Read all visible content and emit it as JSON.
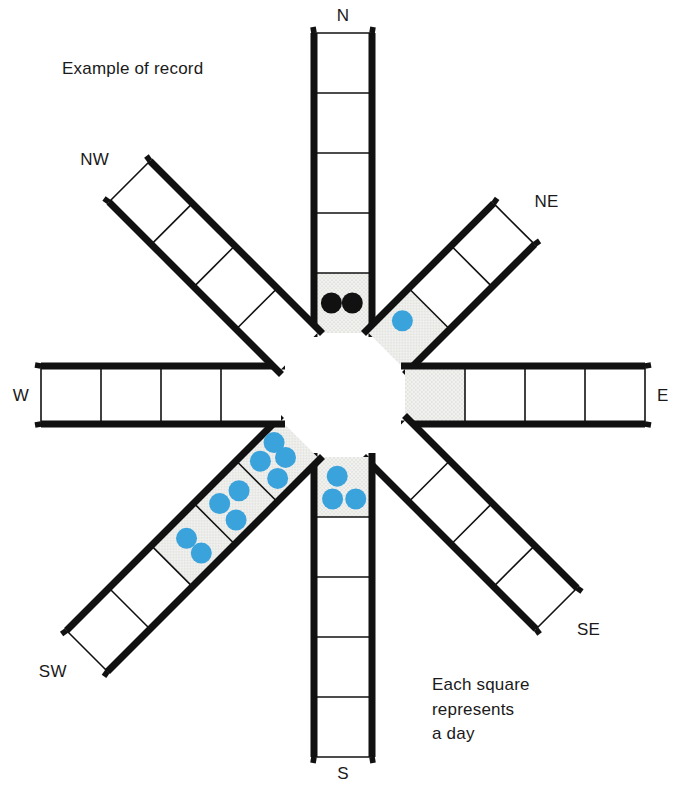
{
  "figure": {
    "title": "Example of record",
    "legend_lines": [
      "Each square",
      "represents",
      "a day"
    ],
    "legend_text": "Each square\nrepresents\na day",
    "colors": {
      "stroke": "#111111",
      "cell_fill": "#ffffff",
      "shaded_fill": "#f1f1ef",
      "blue_dot": "#3ba3dc",
      "black_dot": "#111111",
      "background": "#ffffff"
    },
    "hub": {
      "shape": "octagon",
      "fill": "#ffffff"
    }
  },
  "chart_data": {
    "type": "wind-rose-tally",
    "title": "Example of record",
    "subtitle": "",
    "annotations": [
      "Example of record",
      "Each square represents a day"
    ],
    "legend": "Each square represents a day",
    "unit": "day",
    "dot_colors": {
      "blue": "#3ba3dc",
      "black": "#111111"
    },
    "directions": [
      "N",
      "NE",
      "E",
      "SE",
      "S",
      "SW",
      "W",
      "NW"
    ],
    "arms": [
      {
        "direction": "N",
        "label": "N",
        "angle_deg": 0,
        "cells": 5,
        "cell_data": [
          {
            "index": 1,
            "shaded": true,
            "dots": 2,
            "dot_color": "black"
          },
          {
            "index": 2,
            "shaded": false,
            "dots": 0,
            "dot_color": "blue"
          },
          {
            "index": 3,
            "shaded": false,
            "dots": 0,
            "dot_color": "blue"
          },
          {
            "index": 4,
            "shaded": false,
            "dots": 0,
            "dot_color": "blue"
          },
          {
            "index": 5,
            "shaded": false,
            "dots": 0,
            "dot_color": "blue"
          }
        ],
        "total_dots": 2
      },
      {
        "direction": "NE",
        "label": "NE",
        "angle_deg": 45,
        "cells": 3,
        "cell_data": [
          {
            "index": 1,
            "shaded": true,
            "dots": 1,
            "dot_color": "blue"
          },
          {
            "index": 2,
            "shaded": false,
            "dots": 0,
            "dot_color": "blue"
          },
          {
            "index": 3,
            "shaded": false,
            "dots": 0,
            "dot_color": "blue"
          }
        ],
        "total_dots": 1
      },
      {
        "direction": "E",
        "label": "E",
        "angle_deg": 90,
        "cells": 4,
        "cell_data": [
          {
            "index": 1,
            "shaded": true,
            "dots": 0,
            "dot_color": "blue"
          },
          {
            "index": 2,
            "shaded": false,
            "dots": 0,
            "dot_color": "blue"
          },
          {
            "index": 3,
            "shaded": false,
            "dots": 0,
            "dot_color": "blue"
          },
          {
            "index": 4,
            "shaded": false,
            "dots": 0,
            "dot_color": "blue"
          }
        ],
        "total_dots": 0
      },
      {
        "direction": "SE",
        "label": "SE",
        "angle_deg": 135,
        "cells": 4,
        "cell_data": [
          {
            "index": 1,
            "shaded": false,
            "dots": 0,
            "dot_color": "blue"
          },
          {
            "index": 2,
            "shaded": false,
            "dots": 0,
            "dot_color": "blue"
          },
          {
            "index": 3,
            "shaded": false,
            "dots": 0,
            "dot_color": "blue"
          },
          {
            "index": 4,
            "shaded": false,
            "dots": 0,
            "dot_color": "blue"
          }
        ],
        "total_dots": 0
      },
      {
        "direction": "S",
        "label": "S",
        "angle_deg": 180,
        "cells": 5,
        "cell_data": [
          {
            "index": 1,
            "shaded": true,
            "dots": 3,
            "dot_color": "blue"
          },
          {
            "index": 2,
            "shaded": false,
            "dots": 0,
            "dot_color": "blue"
          },
          {
            "index": 3,
            "shaded": false,
            "dots": 0,
            "dot_color": "blue"
          },
          {
            "index": 4,
            "shaded": false,
            "dots": 0,
            "dot_color": "blue"
          },
          {
            "index": 5,
            "shaded": false,
            "dots": 0,
            "dot_color": "blue"
          }
        ],
        "total_dots": 3
      },
      {
        "direction": "SW",
        "label": "SW",
        "angle_deg": 225,
        "cells": 5,
        "cell_data": [
          {
            "index": 1,
            "shaded": true,
            "dots": 4,
            "dot_color": "blue"
          },
          {
            "index": 2,
            "shaded": true,
            "dots": 3,
            "dot_color": "blue"
          },
          {
            "index": 3,
            "shaded": true,
            "dots": 2,
            "dot_color": "blue"
          },
          {
            "index": 4,
            "shaded": false,
            "dots": 0,
            "dot_color": "blue"
          },
          {
            "index": 5,
            "shaded": false,
            "dots": 0,
            "dot_color": "blue"
          }
        ],
        "total_dots": 9
      },
      {
        "direction": "W",
        "label": "W",
        "angle_deg": 270,
        "cells": 4,
        "cell_data": [
          {
            "index": 1,
            "shaded": false,
            "dots": 0,
            "dot_color": "blue"
          },
          {
            "index": 2,
            "shaded": false,
            "dots": 0,
            "dot_color": "blue"
          },
          {
            "index": 3,
            "shaded": false,
            "dots": 0,
            "dot_color": "blue"
          },
          {
            "index": 4,
            "shaded": false,
            "dots": 0,
            "dot_color": "blue"
          }
        ],
        "total_dots": 0
      },
      {
        "direction": "NW",
        "label": "NW",
        "angle_deg": 315,
        "cells": 4,
        "cell_data": [
          {
            "index": 1,
            "shaded": false,
            "dots": 0,
            "dot_color": "blue"
          },
          {
            "index": 2,
            "shaded": false,
            "dots": 0,
            "dot_color": "blue"
          },
          {
            "index": 3,
            "shaded": false,
            "dots": 0,
            "dot_color": "blue"
          },
          {
            "index": 4,
            "shaded": false,
            "dots": 0,
            "dot_color": "blue"
          }
        ],
        "total_dots": 0
      }
    ],
    "categories": [
      "N",
      "NE",
      "E",
      "SE",
      "S",
      "SW",
      "W",
      "NW"
    ],
    "values": [
      2,
      1,
      0,
      0,
      3,
      9,
      0,
      0
    ],
    "xlabel": "Wind direction",
    "ylabel": "Days recorded"
  }
}
